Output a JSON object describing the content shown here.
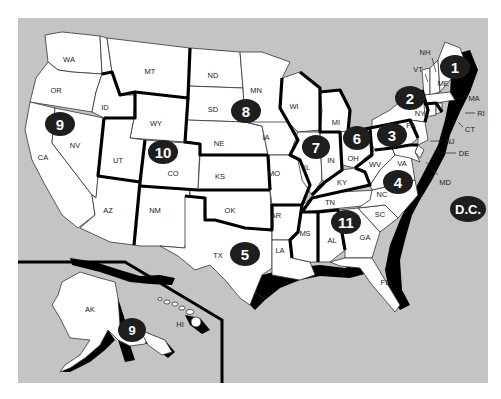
{
  "map": {
    "title": "",
    "colors": {
      "water": "#c4c4c4",
      "land": "#ffffff",
      "border": "#000000",
      "badge": "#1e1e1e",
      "badge_text": "#ffffff"
    },
    "regions": [
      {
        "id": "region-1",
        "label": "1",
        "states": [
          "ME",
          "NH",
          "VT",
          "MA",
          "RI",
          "CT"
        ]
      },
      {
        "id": "region-2",
        "label": "2",
        "states": [
          "NY",
          "NJ"
        ]
      },
      {
        "id": "region-3",
        "label": "3",
        "states": [
          "PA",
          "DE",
          "MD",
          "VA",
          "WV"
        ]
      },
      {
        "id": "region-4",
        "label": "4",
        "states": [
          "KY",
          "TN",
          "NC",
          "SC",
          "GA",
          "AL",
          "MS",
          "FL"
        ]
      },
      {
        "id": "region-5",
        "label": "5",
        "states": [
          "TX",
          "OK",
          "AR",
          "LA",
          "NM"
        ]
      },
      {
        "id": "region-6",
        "label": "6",
        "states": [
          "MI",
          "OH"
        ]
      },
      {
        "id": "region-7",
        "label": "7",
        "states": [
          "IL",
          "IN",
          "WI"
        ]
      },
      {
        "id": "region-8",
        "label": "8",
        "states": [
          "ND",
          "SD",
          "NE",
          "MN",
          "IA",
          "KS",
          "MO"
        ]
      },
      {
        "id": "region-9",
        "label": "9",
        "states": [
          "WA",
          "OR",
          "ID",
          "CA",
          "NV",
          "AZ",
          "AK",
          "HI"
        ]
      },
      {
        "id": "region-10",
        "label": "10",
        "states": [
          "MT",
          "WY",
          "UT",
          "CO"
        ]
      },
      {
        "id": "region-11",
        "label": "11",
        "states": [
          "AL",
          "GA"
        ]
      },
      {
        "id": "region-dc",
        "label": "D.C.",
        "states": []
      }
    ],
    "state_labels": {
      "WA": "WA",
      "OR": "OR",
      "CA": "CA",
      "NV": "NV",
      "ID": "ID",
      "MT": "MT",
      "WY": "WY",
      "UT": "UT",
      "CO": "CO",
      "AZ": "AZ",
      "NM": "NM",
      "ND": "ND",
      "SD": "SD",
      "NE": "NE",
      "KS": "KS",
      "OK": "OK",
      "TX": "TX",
      "MN": "MN",
      "IA": "IA",
      "MO": "MO",
      "AR": "AR",
      "LA": "LA",
      "WI": "WI",
      "IL": "IL",
      "IN": "IN",
      "MI": "MI",
      "OH": "OH",
      "KY": "KY",
      "TN": "TN",
      "MS": "MS",
      "AL": "AL",
      "GA": "GA",
      "FL": "FL",
      "SC": "SC",
      "NC": "NC",
      "VA": "VA",
      "WV": "WV",
      "PA": "PA",
      "NY": "NY",
      "NJ": "NJ",
      "DE": "DE",
      "MD": "MD",
      "CT": "CT",
      "RI": "RI",
      "MA": "MA",
      "VT": "VT",
      "NH": "NH",
      "ME": "ME",
      "AK": "AK",
      "HI": "HI"
    },
    "badges": {
      "b1": "1",
      "b2": "2",
      "b3": "3",
      "b4": "4",
      "b5": "5",
      "b6": "6",
      "b7": "7",
      "b8": "8",
      "b9": "9",
      "b9ak": "9",
      "b10": "10",
      "b11": "11",
      "bdc": "D.C."
    }
  }
}
